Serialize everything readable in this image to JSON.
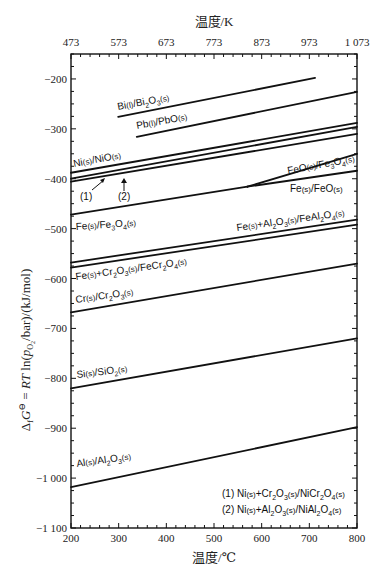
{
  "chart_data": {
    "type": "line",
    "title": "",
    "xlabel": "温度/℃",
    "x2label": "温度/K",
    "ylabel": "ΔfG° = RT ln(pO2/bar)/(kJ/mol)",
    "xlim": [
      200,
      800
    ],
    "ylim": [
      -1100,
      -150
    ],
    "x_ticks": [
      200,
      300,
      400,
      500,
      600,
      700,
      800
    ],
    "x_tick_labels": [
      "200",
      "300",
      "400",
      "500",
      "600",
      "700",
      "800"
    ],
    "x2_ticks": [
      200,
      300,
      400,
      500,
      600,
      700,
      800
    ],
    "x2_tick_labels": [
      "473",
      "573",
      "673",
      "773",
      "873",
      "973",
      "1 073"
    ],
    "y_ticks": [
      -200,
      -300,
      -400,
      -500,
      -600,
      -700,
      -800,
      -900,
      -1000,
      -1100
    ],
    "y_tick_labels": [
      "−200",
      "−300",
      "−400",
      "−500",
      "−600",
      "−700",
      "−800",
      "−900",
      "−1 000",
      "−1 100"
    ],
    "grid": false,
    "legend_position": "lower right (text annotation)",
    "series": [
      {
        "name": "Bi(l)/Bi2O3(s)",
        "x": [
          299,
          712
        ],
        "y": [
          -276,
          -198
        ]
      },
      {
        "name": "Pb(l)/PbO(s)",
        "x": [
          338,
          800
        ],
        "y": [
          -316,
          -226
        ]
      },
      {
        "name": "Ni(s)/NiO(s)",
        "x": [
          200,
          800
        ],
        "y": [
          -388,
          -288
        ]
      },
      {
        "name": "(1) Ni(s)+Cr2O3(s)/NiCr2O4(s)",
        "x": [
          200,
          800
        ],
        "y": [
          -400,
          -296
        ]
      },
      {
        "name": "(2) Ni(s)+Al2O3(s)/NiAl2O4(s)",
        "x": [
          200,
          800
        ],
        "y": [
          -406,
          -310
        ]
      },
      {
        "name": "Fe(s)/Fe3O4(s)",
        "x": [
          200,
          570
        ],
        "y": [
          -472,
          -416
        ]
      },
      {
        "name": "FeO(s)/Fe3O4(s)",
        "x": [
          570,
          800
        ],
        "y": [
          -416,
          -350
        ]
      },
      {
        "name": "Fe(s)/FeO(s)",
        "x": [
          570,
          800
        ],
        "y": [
          -416,
          -384
        ]
      },
      {
        "name": "Fe(s)+Al2O3(s)/FeAl2O4(s)",
        "x": [
          200,
          800
        ],
        "y": [
          -568,
          -482
        ]
      },
      {
        "name": "Fe(s)+Cr2O3(s)/FeCr2O4(s)",
        "x": [
          200,
          800
        ],
        "y": [
          -578,
          -492
        ]
      },
      {
        "name": "Cr(s)/Cr2O3(s)",
        "x": [
          200,
          800
        ],
        "y": [
          -668,
          -570
        ]
      },
      {
        "name": "Si(s)/SiO2(s)",
        "x": [
          200,
          800
        ],
        "y": [
          -820,
          -720
        ]
      },
      {
        "name": "Al(s)/Al2O3(s)",
        "x": [
          200,
          800
        ],
        "y": [
          -1018,
          -898
        ]
      }
    ],
    "annotations": [
      {
        "text": "(1)",
        "arrow_to": "Ni(s)+Cr2O3(s)/NiCr2O4(s) line"
      },
      {
        "text": "(2)",
        "arrow_to": "Ni(s)+Al2O3(s)/NiAl2O4(s) line"
      },
      {
        "text": "(1) Ni(s)+Cr2O3(s)/NiCr2O4(s)"
      },
      {
        "text": "(2) Ni(s)+Al2O3(s)/NiAl2O4(s)"
      }
    ]
  },
  "labels": {
    "x_top_title": "温度/K",
    "x_bottom_title": "温度/℃",
    "ann1": "(1)",
    "ann2": "(2)",
    "legend1": "(1) Ni",
    "legend2": "(2) Ni"
  },
  "style": {
    "line_color": "#111111",
    "axis_color": "#111111",
    "background": "#ffffff"
  }
}
